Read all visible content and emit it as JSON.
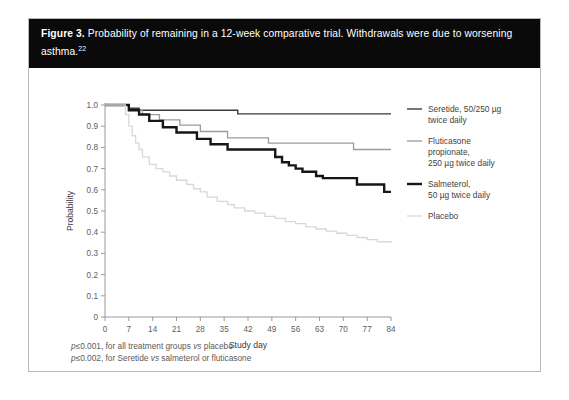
{
  "figure": {
    "label": "Figure 3.",
    "caption": "Probability of remaining in a 12-week comparative trial. Withdrawals were due to worsening asthma.",
    "reference_superscript": "22"
  },
  "legend": {
    "position": "right",
    "items": [
      {
        "name": "seretide",
        "label_line1": "Seretide, 50/250 µg",
        "label_line2": "twice daily",
        "color": "#3a3a3a",
        "width": 1.4
      },
      {
        "name": "fluticasone",
        "label_line1": "Fluticasone",
        "label_line2": "propionate,",
        "label_line3": "250 µg twice daily",
        "color": "#9b9b9b",
        "width": 1.3
      },
      {
        "name": "salmeterol",
        "label_line1": "Salmeterol,",
        "label_line2": "50 µg twice daily",
        "color": "#161616",
        "width": 2.4
      },
      {
        "name": "placebo",
        "label_line1": "Placebo",
        "color": "#d8d8d8",
        "width": 1.3
      }
    ]
  },
  "footnotes": [
    {
      "prefix": "p",
      "operator": "≤0.001,",
      "rest": " for all treatment groups ",
      "ital": "vs",
      "tail": " placebo"
    },
    {
      "prefix": "p",
      "operator": "≤0.002,",
      "rest": " for Seretide ",
      "ital": "vs",
      "tail": " salmeterol or fluticasone"
    }
  ],
  "footnote_lines": [
    "p≤0.001, for all treatment groups vs placebo",
    "p≤0.002, for Seretide vs salmeterol or fluticasone"
  ],
  "chart_data": {
    "type": "line",
    "title": "",
    "xlabel": "Study day",
    "ylabel": "Probability",
    "xlim": [
      0,
      84
    ],
    "ylim": [
      0,
      1.0
    ],
    "xticks": [
      0,
      7,
      14,
      21,
      28,
      35,
      42,
      49,
      56,
      63,
      70,
      77,
      84
    ],
    "xtick_labels": [
      "0",
      "7",
      "14",
      "21",
      "28",
      "35",
      "42",
      "49",
      "56",
      "63",
      "70",
      "77",
      "84"
    ],
    "yticks": [
      0,
      0.1,
      0.2,
      0.3,
      0.4,
      0.5,
      0.6,
      0.7,
      0.8,
      0.9,
      1.0
    ],
    "ytick_labels": [
      "0",
      "0.1",
      "0.2",
      "0.3",
      "0.4",
      "0.5",
      "0.6",
      "0.7",
      "0.8",
      "0.9",
      "1.0"
    ],
    "grid": false,
    "step_type": "post",
    "series": [
      {
        "name": "Seretide, 50/250 µg twice daily",
        "color": "#3a3a3a",
        "width": 1.4,
        "x": [
          0,
          5,
          7,
          8,
          10,
          38,
          39,
          84
        ],
        "y": [
          1.0,
          1.0,
          0.985,
          0.985,
          0.975,
          0.975,
          0.958,
          0.958
        ]
      },
      {
        "name": "Fluticasone propionate, 250 µg twice daily",
        "color": "#9b9b9b",
        "width": 1.3,
        "x": [
          0,
          5,
          7,
          9,
          11,
          14,
          16,
          19,
          22,
          25,
          28,
          31,
          36,
          45,
          48,
          70,
          73,
          84
        ],
        "y": [
          1.0,
          1.0,
          0.975,
          0.975,
          0.955,
          0.955,
          0.93,
          0.93,
          0.905,
          0.905,
          0.875,
          0.875,
          0.845,
          0.845,
          0.82,
          0.82,
          0.79,
          0.79
        ]
      },
      {
        "name": "Salmeterol, 50 µg twice daily",
        "color": "#161616",
        "width": 2.4,
        "x": [
          0,
          6,
          7,
          9,
          10,
          12,
          13,
          15,
          17,
          19,
          21,
          24,
          27,
          29,
          31,
          34,
          36,
          48,
          50,
          52,
          54,
          56,
          58,
          62,
          64,
          72,
          74,
          80,
          82,
          84
        ],
        "y": [
          1.0,
          1.0,
          0.975,
          0.975,
          0.955,
          0.955,
          0.925,
          0.925,
          0.895,
          0.895,
          0.87,
          0.87,
          0.84,
          0.84,
          0.815,
          0.815,
          0.79,
          0.79,
          0.755,
          0.73,
          0.715,
          0.7,
          0.685,
          0.665,
          0.655,
          0.655,
          0.625,
          0.625,
          0.59,
          0.59
        ]
      },
      {
        "name": "Placebo",
        "color": "#d8d8d8",
        "width": 1.3,
        "x": [
          0,
          5,
          6,
          7,
          8,
          9,
          10,
          11,
          13,
          15,
          17,
          19,
          21,
          24,
          26,
          28,
          30,
          33,
          36,
          38,
          41,
          44,
          47,
          50,
          53,
          56,
          59,
          62,
          65,
          68,
          71,
          74,
          77,
          80,
          84
        ],
        "y": [
          1.0,
          1.0,
          0.955,
          0.9,
          0.855,
          0.82,
          0.79,
          0.755,
          0.72,
          0.7,
          0.685,
          0.665,
          0.645,
          0.625,
          0.605,
          0.59,
          0.565,
          0.545,
          0.53,
          0.515,
          0.5,
          0.49,
          0.475,
          0.465,
          0.45,
          0.44,
          0.425,
          0.415,
          0.405,
          0.395,
          0.385,
          0.375,
          0.365,
          0.355,
          0.35
        ]
      }
    ]
  }
}
